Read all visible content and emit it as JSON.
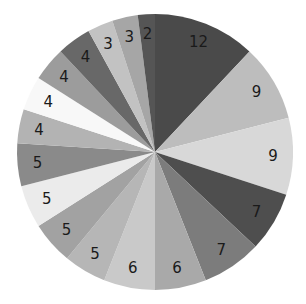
{
  "chart_data": {
    "type": "pie",
    "title": "",
    "start_angle": "12 o'clock",
    "direction": "clockwise",
    "legend": "none",
    "values": [
      12,
      9,
      9,
      7,
      7,
      6,
      6,
      5,
      5,
      5,
      5,
      4,
      4,
      4,
      4,
      3,
      3,
      2
    ],
    "labels": [
      "12",
      "9",
      "9",
      "7",
      "7",
      "6",
      "6",
      "5",
      "5",
      "5",
      "5",
      "4",
      "4",
      "4",
      "4",
      "3",
      "3",
      "2"
    ],
    "colors": [
      "#4a4a4a",
      "#bdbdbd",
      "#d8d8d8",
      "#4e4e4e",
      "#7c7c7c",
      "#a9a9a9",
      "#c9c9c9",
      "#b6b6b6",
      "#a2a2a2",
      "#ebebeb",
      "#8a8a8a",
      "#b3b3b3",
      "#f8f8f8",
      "#9c9c9c",
      "#686868",
      "#c2c2c2",
      "#a6a6a6",
      "#555555"
    ],
    "total": 100
  }
}
